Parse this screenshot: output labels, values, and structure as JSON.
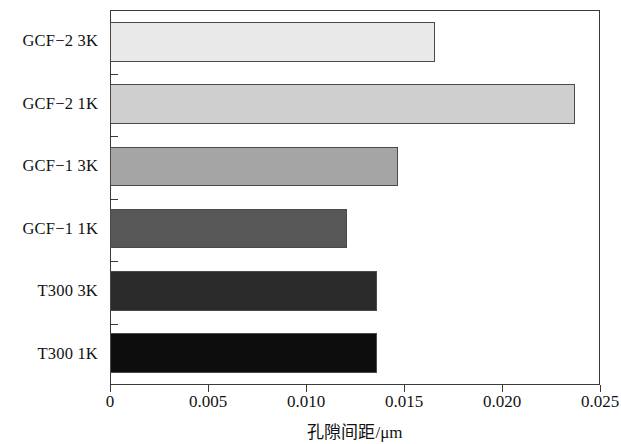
{
  "chart_data": {
    "type": "bar",
    "orientation": "horizontal",
    "title": "",
    "subtitle": "",
    "xlabel": "孔隙间距/μm",
    "ylabel": "",
    "xlim": [
      0,
      0.025
    ],
    "xticks": [
      0,
      0.005,
      0.01,
      0.015,
      0.02,
      0.025
    ],
    "xtick_labels": [
      "0",
      "0.005",
      "0.010",
      "0.015",
      "0.020",
      "0.025"
    ],
    "grid": false,
    "legend": null,
    "categories": [
      "T300 1K",
      "T300 3K",
      "GCF-1 1K",
      "GCF-1 3K",
      "GCF-2 1K",
      "GCF-2 3K"
    ],
    "values": [
      0.0136,
      0.0136,
      0.0121,
      0.0147,
      0.0237,
      0.0166
    ],
    "bars": [
      {
        "category": "GCF−2 3K",
        "value": 0.0166,
        "color": "#e9e9e9"
      },
      {
        "category": "GCF−2 1K",
        "value": 0.0237,
        "color": "#cfcfcf"
      },
      {
        "category": "GCF−1 3K",
        "value": 0.0147,
        "color": "#a5a5a5"
      },
      {
        "category": "GCF−1 1K",
        "value": 0.0121,
        "color": "#575757"
      },
      {
        "category": "T300 3K",
        "value": 0.0136,
        "color": "#2b2b2b"
      },
      {
        "category": "T300 1K",
        "value": 0.0136,
        "color": "#0d0d0d"
      }
    ],
    "axis_color": "#3a3a3a",
    "background_color": "#ffffff"
  }
}
